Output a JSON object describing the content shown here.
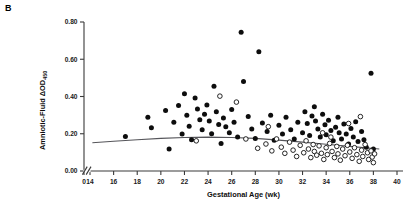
{
  "panel": {
    "label": "B"
  },
  "axes": {
    "y_title_main": "Amniotic-Fluid ΔOD",
    "y_title_sub": "450",
    "x_title": "Gestational Age (wk)",
    "y_ticks": [
      "0.00",
      "0.20",
      "0.40",
      "0.60",
      "0.80"
    ],
    "x_ticks": [
      "0",
      "14",
      "16",
      "18",
      "20",
      "22",
      "24",
      "26",
      "28",
      "30",
      "32",
      "34",
      "36",
      "38",
      "40"
    ],
    "axis_break": "//"
  },
  "colors": {
    "filled_marker": "#0d0d0d",
    "open_marker_stroke": "#0d0d0d",
    "open_marker_fill": "#ffffff",
    "trend_line": "#55555a",
    "axis": "#3a3a3a",
    "background": "#ffffff"
  },
  "chart_data": {
    "type": "scatter",
    "title": "",
    "xlabel": "Gestational Age (wk)",
    "ylabel": "Amniotic-Fluid ΔOD450",
    "xlim": [
      14,
      40
    ],
    "ylim": [
      0.0,
      0.8
    ],
    "x_break_after": 0,
    "grid": false,
    "legend": "none",
    "series": [
      {
        "name": "filled-circles",
        "marker": "filled-circle",
        "points": [
          [
            17.0,
            0.185
          ],
          [
            18.9,
            0.288
          ],
          [
            19.2,
            0.232
          ],
          [
            20.4,
            0.325
          ],
          [
            20.7,
            0.118
          ],
          [
            21.1,
            0.262
          ],
          [
            21.5,
            0.352
          ],
          [
            21.8,
            0.198
          ],
          [
            22.0,
            0.415
          ],
          [
            22.2,
            0.3
          ],
          [
            22.4,
            0.24
          ],
          [
            22.6,
            0.168
          ],
          [
            22.9,
            0.392
          ],
          [
            23.1,
            0.333
          ],
          [
            23.3,
            0.275
          ],
          [
            23.5,
            0.222
          ],
          [
            23.7,
            0.305
          ],
          [
            23.9,
            0.355
          ],
          [
            24.1,
            0.268
          ],
          [
            24.3,
            0.2
          ],
          [
            24.5,
            0.455
          ],
          [
            24.7,
            0.318
          ],
          [
            24.9,
            0.25
          ],
          [
            25.1,
            0.148
          ],
          [
            25.3,
            0.285
          ],
          [
            25.5,
            0.238
          ],
          [
            25.8,
            0.205
          ],
          [
            26.0,
            0.33
          ],
          [
            26.2,
            0.262
          ],
          [
            26.5,
            0.182
          ],
          [
            26.8,
            0.745
          ],
          [
            27.0,
            0.48
          ],
          [
            27.4,
            0.292
          ],
          [
            27.7,
            0.225
          ],
          [
            28.0,
            0.175
          ],
          [
            28.3,
            0.64
          ],
          [
            28.6,
            0.258
          ],
          [
            29.0,
            0.212
          ],
          [
            29.3,
            0.3
          ],
          [
            29.6,
            0.165
          ],
          [
            30.0,
            0.245
          ],
          [
            30.3,
            0.198
          ],
          [
            30.6,
            0.288
          ],
          [
            31.0,
            0.222
          ],
          [
            31.3,
            0.172
          ],
          [
            31.6,
            0.262
          ],
          [
            32.0,
            0.205
          ],
          [
            32.2,
            0.318
          ],
          [
            32.4,
            0.255
          ],
          [
            32.6,
            0.19
          ],
          [
            32.8,
            0.295
          ],
          [
            33.0,
            0.345
          ],
          [
            33.1,
            0.268
          ],
          [
            33.3,
            0.225
          ],
          [
            33.5,
            0.182
          ],
          [
            33.7,
            0.305
          ],
          [
            33.9,
            0.248
          ],
          [
            34.0,
            0.195
          ],
          [
            34.2,
            0.272
          ],
          [
            34.4,
            0.218
          ],
          [
            34.6,
            0.162
          ],
          [
            34.8,
            0.235
          ],
          [
            35.0,
            0.288
          ],
          [
            35.1,
            0.205
          ],
          [
            35.3,
            0.172
          ],
          [
            35.5,
            0.252
          ],
          [
            35.7,
            0.198
          ],
          [
            35.9,
            0.145
          ],
          [
            36.1,
            0.228
          ],
          [
            36.3,
            0.182
          ],
          [
            36.5,
            0.265
          ],
          [
            36.7,
            0.158
          ],
          [
            37.0,
            0.212
          ],
          [
            37.2,
            0.168
          ],
          [
            37.4,
            0.128
          ],
          [
            37.8,
            0.525
          ],
          [
            38.0,
            0.118
          ]
        ]
      },
      {
        "name": "open-circles",
        "marker": "open-circle",
        "points": [
          [
            23.0,
            0.162
          ],
          [
            25.0,
            0.402
          ],
          [
            26.4,
            0.37
          ],
          [
            27.2,
            0.172
          ],
          [
            28.2,
            0.122
          ],
          [
            28.9,
            0.145
          ],
          [
            29.4,
            0.108
          ],
          [
            29.8,
            0.172
          ],
          [
            30.2,
            0.128
          ],
          [
            30.5,
            0.095
          ],
          [
            30.9,
            0.155
          ],
          [
            31.2,
            0.112
          ],
          [
            31.5,
            0.078
          ],
          [
            31.8,
            0.138
          ],
          [
            32.1,
            0.098
          ],
          [
            32.3,
            0.162
          ],
          [
            32.5,
            0.118
          ],
          [
            32.7,
            0.072
          ],
          [
            32.9,
            0.142
          ],
          [
            33.0,
            0.105
          ],
          [
            33.2,
            0.085
          ],
          [
            33.4,
            0.135
          ],
          [
            33.6,
            0.095
          ],
          [
            33.8,
            0.062
          ],
          [
            34.0,
            0.125
          ],
          [
            34.1,
            0.088
          ],
          [
            34.3,
            0.148
          ],
          [
            34.5,
            0.105
          ],
          [
            34.7,
            0.072
          ],
          [
            34.9,
            0.132
          ],
          [
            35.0,
            0.092
          ],
          [
            35.2,
            0.058
          ],
          [
            35.4,
            0.118
          ],
          [
            35.6,
            0.082
          ],
          [
            35.8,
            0.138
          ],
          [
            36.0,
            0.102
          ],
          [
            36.2,
            0.068
          ],
          [
            36.4,
            0.125
          ],
          [
            36.6,
            0.088
          ],
          [
            36.8,
            0.052
          ],
          [
            37.0,
            0.112
          ],
          [
            37.1,
            0.078
          ],
          [
            37.3,
            0.142
          ],
          [
            37.5,
            0.098
          ],
          [
            37.6,
            0.062
          ],
          [
            37.8,
            0.108
          ],
          [
            37.9,
            0.075
          ],
          [
            38.0,
            0.045
          ],
          [
            38.1,
            0.092
          ],
          [
            36.9,
            0.292
          ],
          [
            35.9,
            0.255
          ],
          [
            34.4,
            0.182
          ],
          [
            33.7,
            0.205
          ],
          [
            29.1,
            0.238
          ]
        ]
      }
    ],
    "trend_line": {
      "name": "regression-curve",
      "points": [
        [
          14.2,
          0.152
        ],
        [
          16.0,
          0.16
        ],
        [
          18.0,
          0.168
        ],
        [
          20.0,
          0.175
        ],
        [
          22.0,
          0.18
        ],
        [
          24.0,
          0.182
        ],
        [
          26.0,
          0.18
        ],
        [
          28.0,
          0.175
        ],
        [
          30.0,
          0.166
        ],
        [
          32.0,
          0.155
        ],
        [
          34.0,
          0.144
        ],
        [
          36.0,
          0.132
        ],
        [
          38.5,
          0.118
        ]
      ]
    }
  }
}
